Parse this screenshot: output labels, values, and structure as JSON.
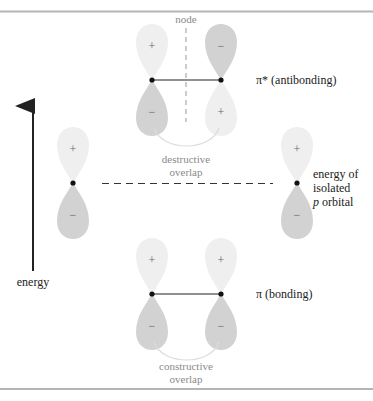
{
  "diagram": {
    "labels": {
      "node": "node",
      "antibonding": "π* (antibonding)",
      "bonding": "π (bonding)",
      "destructive_1": "destructive",
      "destructive_2": "overlap",
      "constructive_1": "constructive",
      "constructive_2": "overlap",
      "isolated_1": "energy of",
      "isolated_2": "isolated",
      "isolated_3_italic": "p",
      "isolated_3_rest": " orbital",
      "energy": "energy"
    },
    "signs": {
      "plus": "+",
      "minus": "−"
    },
    "colors": {
      "light_lobe": "#efefef",
      "dark_lobe": "#d2d2d2",
      "text": "#222222",
      "gray_text": "#8a8a8a",
      "border": "#b5b5b5",
      "line": "#222222"
    }
  }
}
